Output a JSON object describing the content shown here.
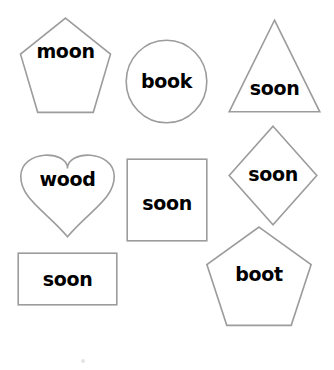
{
  "page": {
    "background_color": "#ffffff",
    "outline_color": "#9c9c9c",
    "text_color": "#000000",
    "width": 334,
    "height": 370
  },
  "shapes": [
    {
      "id": "pentagon-moon",
      "shape": "pentagon",
      "label": "moon",
      "x": 17,
      "y": 20,
      "w": 97,
      "h": 93,
      "label_top": 42
    },
    {
      "id": "circle-book",
      "shape": "circle",
      "label": "book",
      "x": 125,
      "y": 39,
      "w": 83,
      "h": 85,
      "label_top": 72
    },
    {
      "id": "triangle-soon",
      "shape": "triangle",
      "label": "soon",
      "x": 228,
      "y": 19,
      "w": 93,
      "h": 94,
      "label_top": 79
    },
    {
      "id": "heart-wood",
      "shape": "heart",
      "label": "wood",
      "x": 15,
      "y": 144,
      "w": 105,
      "h": 94,
      "label_top": 170
    },
    {
      "id": "square-soon",
      "shape": "square",
      "label": "soon",
      "x": 126,
      "y": 158,
      "w": 82,
      "h": 84,
      "label_top": 194
    },
    {
      "id": "diamond-soon",
      "shape": "diamond",
      "label": "soon",
      "x": 228,
      "y": 125,
      "w": 90,
      "h": 101,
      "label_top": 165
    },
    {
      "id": "rectangle-soon",
      "shape": "rectangle",
      "label": "soon",
      "x": 17,
      "y": 252,
      "w": 101,
      "h": 54,
      "label_top": 270
    },
    {
      "id": "pentagon-boot",
      "shape": "pentagon",
      "label": "boot",
      "x": 203,
      "y": 229,
      "w": 112,
      "h": 97,
      "label_top": 265
    }
  ],
  "stray_mark": {
    "name": "stray-mark",
    "x": 81,
    "y": 359
  }
}
